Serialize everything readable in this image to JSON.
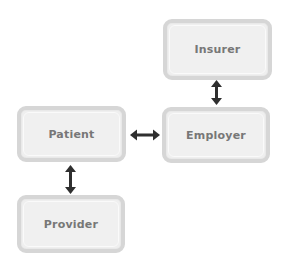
{
  "diagram": {
    "nodes": [
      {
        "id": "insurer",
        "label": "Insurer"
      },
      {
        "id": "employer",
        "label": "Employer"
      },
      {
        "id": "patient",
        "label": "Patient"
      },
      {
        "id": "provider",
        "label": "Provider"
      }
    ],
    "edges": [
      {
        "from": "insurer",
        "to": "employer",
        "direction": "bidirectional"
      },
      {
        "from": "patient",
        "to": "employer",
        "direction": "bidirectional"
      },
      {
        "from": "patient",
        "to": "provider",
        "direction": "bidirectional"
      }
    ],
    "colors": {
      "node_fill": "#efefef",
      "node_border": "#d6d6d6",
      "label_text": "#777777",
      "arrow": "#2f2f2f"
    }
  }
}
